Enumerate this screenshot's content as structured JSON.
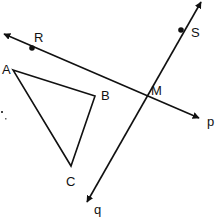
{
  "colors": {
    "stroke": "#111111",
    "background": "#ffffff"
  },
  "lines": [
    {
      "name": "p",
      "label": "p",
      "label_pos": [
        210,
        126
      ]
    },
    {
      "name": "q",
      "label": "q",
      "label_pos": [
        96,
        215
      ]
    }
  ],
  "points": [
    {
      "name": "R",
      "label": "R",
      "pos": [
        32,
        48
      ],
      "label_pos": [
        34,
        42
      ]
    },
    {
      "name": "S",
      "label": "S",
      "pos": [
        181,
        30
      ],
      "label_pos": [
        191,
        37
      ]
    },
    {
      "name": "M",
      "label": "M",
      "pos": [
        146,
        97
      ],
      "label_pos": [
        152,
        95
      ]
    }
  ],
  "triangle": {
    "vertices": [
      {
        "label": "A",
        "pos": [
          13,
          70
        ],
        "label_pos": [
          3,
          74
        ]
      },
      {
        "label": "B",
        "pos": [
          95,
          96
        ],
        "label_pos": [
          102,
          99
        ]
      },
      {
        "label": "C",
        "pos": [
          71,
          166
        ],
        "label_pos": [
          66,
          185
        ]
      }
    ]
  }
}
